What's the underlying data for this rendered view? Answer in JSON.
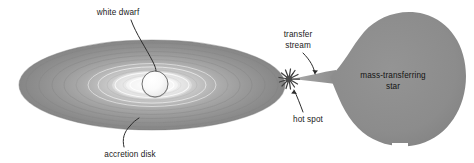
{
  "diagram": {
    "background_color": "#ffffff",
    "width": 474,
    "height": 163,
    "labels": {
      "white_dwarf": "white dwarf",
      "accretion_disk": "accretion disk",
      "transfer_stream_line1": "transfer",
      "transfer_stream_line2": "stream",
      "hot_spot": "hot spot",
      "mass_star_line1": "mass-transferring",
      "mass_star_line2": "star"
    },
    "colors": {
      "disk_outer": "#8e8e8e",
      "disk_mid": "#a3a3a3",
      "disk_inner": "#cfcfcf",
      "disk_core_glow": "#f2f2f2",
      "white_dwarf_body": "#fbfbfb",
      "white_dwarf_outline": "#5a5a5a",
      "companion_star": "#8d8d8d",
      "stream": "#9a9a9a",
      "hot_spot": "#4f4f4f",
      "leader_line": "#2b2b2b",
      "text": "#1a1a1a"
    },
    "elements": {
      "accretion_disk": {
        "name": "accretion disk",
        "shape": "ellipse",
        "center_x": 152,
        "center_y": 85,
        "radius_x": 133,
        "radius_y": 45,
        "ring_count": 11
      },
      "white_dwarf": {
        "name": "white dwarf",
        "shape": "sphere",
        "center_x": 155,
        "center_y": 84,
        "radius": 13
      },
      "hot_spot": {
        "name": "hot spot",
        "shape": "starburst",
        "center_x": 289,
        "center_y": 79,
        "radius": 10,
        "spike_count": 14
      },
      "transfer_stream": {
        "name": "transfer stream",
        "shape": "narrow band",
        "from_x": 334,
        "from_y": 76,
        "to_x": 291,
        "to_y": 79
      },
      "mass_transferring_star": {
        "name": "mass-transferring star",
        "shape": "Roche lobe teardrop",
        "center_x": 394,
        "center_y": 78,
        "tip_x": 330,
        "tip_y": 77
      }
    }
  }
}
